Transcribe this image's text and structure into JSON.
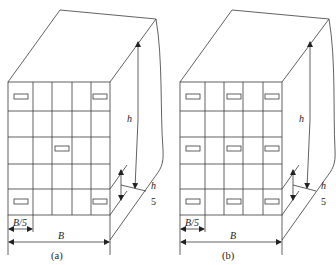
{
  "diagrams": [
    {
      "id": "a",
      "caption": "(a)",
      "width_label": "B",
      "column_label": "B/5",
      "height_label": "h",
      "floor_label_num": "h",
      "floor_label_den": "5",
      "columns": 5,
      "rows": 5,
      "windows": [
        {
          "row": 0,
          "col": 0
        },
        {
          "row": 0,
          "col": 4
        },
        {
          "row": 2,
          "col": 2
        },
        {
          "row": 4,
          "col": 0
        },
        {
          "row": 4,
          "col": 4
        }
      ]
    },
    {
      "id": "b",
      "caption": "(b)",
      "width_label": "B",
      "column_label": "B/5",
      "height_label": "h",
      "floor_label_num": "h",
      "floor_label_den": "5",
      "columns": 5,
      "rows": 5,
      "windows": [
        {
          "row": 0,
          "col": 0
        },
        {
          "row": 0,
          "col": 2
        },
        {
          "row": 0,
          "col": 4
        },
        {
          "row": 2,
          "col": 0
        },
        {
          "row": 2,
          "col": 2
        },
        {
          "row": 2,
          "col": 4
        },
        {
          "row": 4,
          "col": 0
        },
        {
          "row": 4,
          "col": 2
        },
        {
          "row": 4,
          "col": 4
        }
      ]
    }
  ]
}
